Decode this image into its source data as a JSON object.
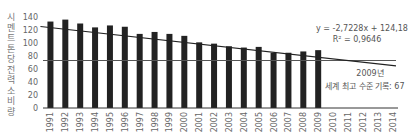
{
  "chart_data": {
    "type": "bar",
    "title": "",
    "xlabel": "",
    "ylabel": "시멘트 톤당 전력 소비량",
    "ylim": [
      0,
      140
    ],
    "yticks": [
      0,
      20,
      40,
      60,
      80,
      100,
      120,
      140
    ],
    "categories": [
      "1991",
      "1992",
      "1993",
      "1994",
      "1995",
      "1996",
      "1997",
      "1998",
      "1999",
      "2000",
      "2001",
      "2002",
      "2003",
      "2004",
      "2005",
      "2006",
      "2007",
      "2008",
      "2009",
      "2010",
      "2011",
      "2012",
      "2013",
      "2014"
    ],
    "series": [
      {
        "name": "시멘트 톤당 전력 소비량",
        "values": [
          133,
          136,
          130,
          124,
          127,
          125,
          114,
          117,
          114,
          111,
          101,
          99,
          95,
          93,
          94,
          85,
          85,
          87,
          89,
          null,
          null,
          null,
          null,
          null
        ],
        "color": "#222222"
      }
    ],
    "trendline": {
      "equation": "y = -2,7228x + 124,18",
      "r_squared": "R² = 0,9646",
      "slope": -2.7228,
      "intercept": 124.18,
      "color": "#222222"
    },
    "reference_line": {
      "value": 67,
      "color": "#555555",
      "label_year": "2009년",
      "label_text": "세계 최고 수준 기록: 67"
    },
    "grid": false,
    "legend": "none"
  }
}
